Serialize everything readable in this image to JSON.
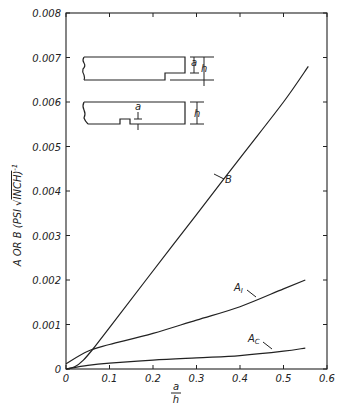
{
  "chart_data": {
    "type": "line",
    "title": "",
    "xlabel": "a/h",
    "xlabel_numerator": "a",
    "xlabel_denominator": "h",
    "ylabel": "A OR B (PSI √INCH)⁻¹",
    "xlim": [
      0,
      0.6
    ],
    "ylim": [
      0,
      0.008
    ],
    "grid": false,
    "legend": "none (curves labeled inline)",
    "x_ticks": [
      "0",
      "0.1",
      "0.2",
      "0.3",
      "0.4",
      "0.5",
      "0.6"
    ],
    "y_ticks": [
      "0",
      "0.001",
      "0.002",
      "0.003",
      "0.004",
      "0.005",
      "0.006",
      "0.007",
      "0.008"
    ],
    "series": [
      {
        "name": "B",
        "x": [
          0,
          0.02,
          0.04,
          0.062,
          0.1,
          0.184,
          0.3,
          0.4,
          0.5,
          0.557
        ],
        "values": [
          0,
          5e-05,
          0.0002,
          0.00045,
          0.00093,
          0.002,
          0.00347,
          0.00474,
          0.006,
          0.0068
        ]
      },
      {
        "name": "A₁",
        "x": [
          0,
          0.05,
          0.1,
          0.2,
          0.3,
          0.4,
          0.5,
          0.55
        ],
        "values": [
          0.00012,
          0.0004,
          0.00055,
          0.0008,
          0.0011,
          0.0014,
          0.0018,
          0.002
        ]
      },
      {
        "name": "Ac",
        "x": [
          0,
          0.05,
          0.1,
          0.2,
          0.3,
          0.4,
          0.5,
          0.55
        ],
        "values": [
          0,
          8e-05,
          0.00013,
          0.0002,
          0.00025,
          0.0003,
          0.0004,
          0.00047
        ]
      }
    ],
    "annotations": [
      {
        "text": "B",
        "near_series": "B",
        "at_x": 0.34
      },
      {
        "text": "A₁",
        "near_series": "A₁",
        "at_x": 0.44
      },
      {
        "text": "Ac",
        "near_series": "Ac",
        "at_x": 0.44
      },
      {
        "text": "Inset: edge-notched specimen, notch depth a, thickness h"
      },
      {
        "text": "Inset: center-notched specimen, notch depth a, thickness h"
      }
    ]
  },
  "labels": {
    "inset_a": "a",
    "inset_h": "h",
    "series_B": "B",
    "series_A1_main": "A",
    "series_A1_sub": "I",
    "series_Ac_main": "A",
    "series_Ac_sub": "C",
    "xlabel_num": "a",
    "xlabel_den": "h",
    "ylabel_prefix": "A OR B  (PSI ",
    "ylabel_unit": "INCH)",
    "ylabel_exp": "-1"
  }
}
